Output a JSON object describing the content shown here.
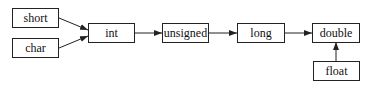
{
  "diagram": {
    "nodes": {
      "short": "short",
      "char": "char",
      "int": "int",
      "unsigned": "unsigned",
      "long": "long",
      "double": "double",
      "float": "float"
    },
    "edges": [
      {
        "from": "short",
        "to": "int"
      },
      {
        "from": "char",
        "to": "int"
      },
      {
        "from": "int",
        "to": "unsigned"
      },
      {
        "from": "unsigned",
        "to": "long"
      },
      {
        "from": "long",
        "to": "double"
      },
      {
        "from": "float",
        "to": "double"
      }
    ],
    "colors": {
      "stroke": "#222222",
      "background": "#ffffff",
      "text": "#111111"
    }
  }
}
